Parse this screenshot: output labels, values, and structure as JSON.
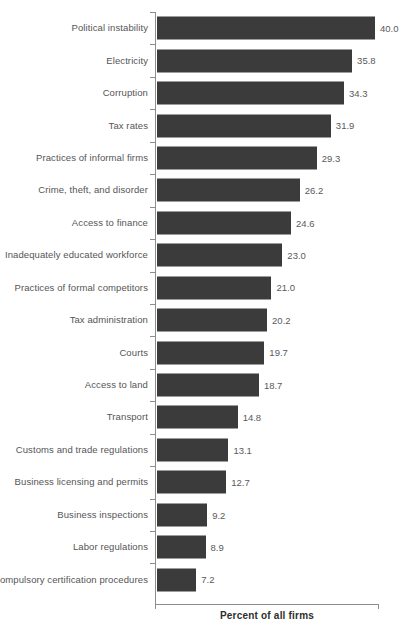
{
  "chart_data": {
    "type": "bar",
    "orientation": "horizontal",
    "title": "",
    "subtitle": "",
    "xlabel": "Percent of all firms",
    "ylabel": "",
    "xlim": [
      0,
      40
    ],
    "grid": false,
    "legend": null,
    "bar_color": "#3b3b3b",
    "axis_color": "#8d8d8d",
    "label_color": "#555555",
    "categories": [
      "Political instability",
      "Electricity",
      "Corruption",
      "Tax rates",
      "Practices of informal firms",
      "Crime, theft, and disorder",
      "Access to finance",
      "Inadequately educated workforce",
      "Practices of formal competitors",
      "Tax administration",
      "Courts",
      "Access to land",
      "Transport",
      "Customs and trade regulations",
      "Business licensing and permits",
      "Business inspections",
      "Labor regulations",
      "Compulsory certification procedures"
    ],
    "values": [
      40.0,
      35.8,
      34.3,
      31.9,
      29.3,
      26.2,
      24.6,
      23.0,
      21.0,
      20.2,
      19.7,
      18.7,
      14.8,
      13.1,
      12.7,
      9.2,
      8.9,
      7.2
    ],
    "value_labels": [
      "40.0",
      "35.8",
      "34.3",
      "31.9",
      "29.3",
      "26.2",
      "24.6",
      "23.0",
      "21.0",
      "20.2",
      "19.7",
      "18.7",
      "14.8",
      "13.1",
      "12.7",
      "9.2",
      "8.9",
      "7.2"
    ]
  }
}
